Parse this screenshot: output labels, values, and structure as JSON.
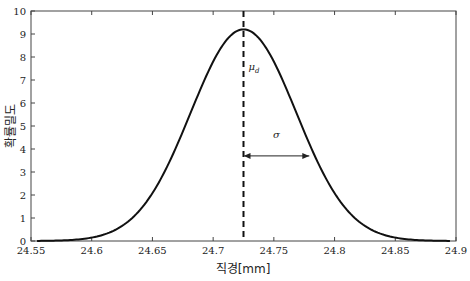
{
  "chart_data": {
    "type": "line",
    "title": "",
    "xlabel": "직경[mm]",
    "ylabel": "확률밀도",
    "xlim": [
      24.55,
      24.9
    ],
    "ylim": [
      0,
      10
    ],
    "xticks": [
      "24.55",
      "24.6",
      "24.65",
      "24.7",
      "24.75",
      "24.8",
      "24.85",
      "24.9"
    ],
    "yticks": [
      "0",
      "1",
      "2",
      "3",
      "4",
      "5",
      "6",
      "7",
      "8",
      "9",
      "10"
    ],
    "grid": false,
    "legend": null,
    "series": [
      {
        "name": "normal-pdf",
        "distribution": "normal",
        "mean": 24.725,
        "sigma": 0.0435,
        "peak": 9.2,
        "x": [
          24.555,
          24.6,
          24.625,
          24.65,
          24.675,
          24.7,
          24.725,
          24.75,
          24.775,
          24.8,
          24.825,
          24.85,
          24.895
        ],
        "y": [
          0.0,
          0.15,
          0.6,
          2.0,
          4.4,
          7.4,
          9.2,
          7.4,
          4.4,
          2.0,
          0.6,
          0.15,
          0.0
        ]
      }
    ],
    "annotations": [
      {
        "type": "vline",
        "x": 24.725,
        "style": "dashed",
        "label": "μ_d"
      },
      {
        "type": "double-arrow",
        "x0": 24.725,
        "x1": 24.78,
        "y": 3.7,
        "label": "σ"
      }
    ]
  },
  "labels": {
    "mu": "μ",
    "mu_sub": "d",
    "sigma": "σ",
    "xlabel": "직경[mm]",
    "ylabel": "확률밀도"
  }
}
